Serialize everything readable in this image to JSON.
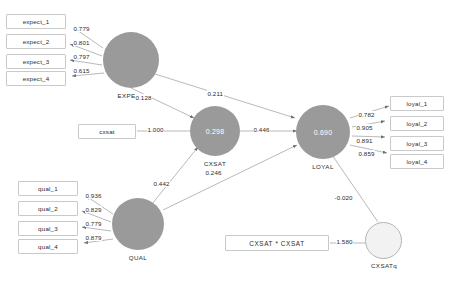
{
  "diagram": {
    "colors": {
      "construct_fill": "#9a9a9a",
      "quadratic_fill": "#f2f2f2",
      "quadratic_stroke": "#b4b4b4",
      "box_stroke": "#c9c9c9",
      "edge": "#8e8e8e",
      "text": "#2b2b2b",
      "inner_text": "#ffffff"
    },
    "constructs": [
      {
        "id": "expect",
        "label": "EXPECT",
        "r2": ""
      },
      {
        "id": "cxsat",
        "label": "CXSAT",
        "r2": "0.298"
      },
      {
        "id": "loyal",
        "label": "LOYAL",
        "r2": "0.690"
      },
      {
        "id": "qual",
        "label": "QUAL",
        "r2": ""
      },
      {
        "id": "cxsatq",
        "label": "CXSATq",
        "r2": ""
      }
    ],
    "indicators": {
      "expect": [
        "expect_1",
        "expect_2",
        "expect_3",
        "expect_4"
      ],
      "qual": [
        "qual_1",
        "qual_2",
        "qual_3",
        "qual_4"
      ],
      "loyal": [
        "loyal_1",
        "loyal_2",
        "loyal_3",
        "loyal_4"
      ],
      "cxsat": [
        "cxsat"
      ],
      "cxsatq": [
        "CXSAT * CXSAT"
      ]
    },
    "loadings": {
      "expect": [
        "0.779",
        "0.801",
        "0.797",
        "0.615"
      ],
      "qual": [
        "0.936",
        "0.829",
        "0.779",
        "0.879"
      ],
      "loyal": [
        "0.782",
        "0.905",
        "0.891",
        "0.859"
      ],
      "cxsat": [
        "1.000"
      ],
      "cxsatq": [
        "1.580"
      ]
    },
    "paths": [
      {
        "from": "EXPECT",
        "to": "CXSAT",
        "coef": "0.128"
      },
      {
        "from": "EXPECT",
        "to": "LOYAL",
        "coef": "0.211"
      },
      {
        "from": "QUAL",
        "to": "CXSAT",
        "coef": "0.442"
      },
      {
        "from": "QUAL",
        "to": "LOYAL",
        "coef": "0.246"
      },
      {
        "from": "CXSAT",
        "to": "LOYAL",
        "coef": "0.446"
      },
      {
        "from": "CXSATq",
        "to": "LOYAL",
        "coef": "-0.020"
      }
    ]
  }
}
